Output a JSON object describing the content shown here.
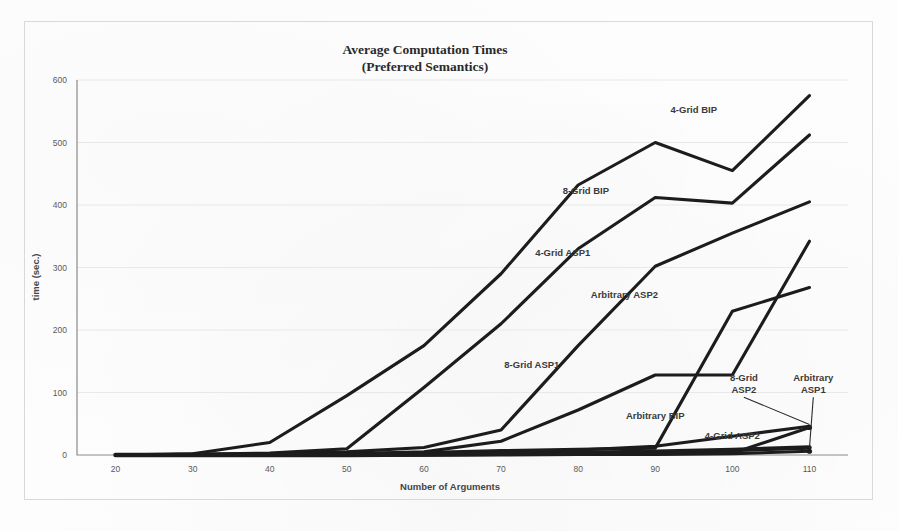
{
  "chart_data": {
    "type": "line",
    "title": "Average Computation Times",
    "subtitle": "(Preferred Semantics)",
    "xlabel": "Number of Arguments",
    "ylabel": "time (sec.)",
    "x": [
      20,
      30,
      40,
      50,
      60,
      70,
      80,
      90,
      100,
      110
    ],
    "xticks": [
      "20",
      "30",
      "40",
      "50",
      "60",
      "70",
      "80",
      "90",
      "100",
      "110"
    ],
    "yticks": [
      "0",
      "100",
      "200",
      "300",
      "400",
      "500",
      "600"
    ],
    "xlim": [
      15,
      115
    ],
    "ylim": [
      0,
      600
    ],
    "grid": true,
    "legend_position": "inline-annotations",
    "line_color": "#1c1c1c",
    "grid_color": "#e8e8e8",
    "axis_color": "#8a8a8a",
    "series": [
      {
        "name": "4-Grid BIP",
        "values": [
          0,
          2,
          20,
          95,
          175,
          290,
          432,
          500,
          455,
          575
        ],
        "label_x": 95,
        "label_y": 548,
        "anchor": "middle",
        "thick": false
      },
      {
        "name": "8-Grid BIP",
        "values": [
          0,
          1,
          3,
          10,
          108,
          210,
          330,
          412,
          403,
          512
        ],
        "label_x": 81,
        "label_y": 418,
        "anchor": "middle",
        "thick": false
      },
      {
        "name": "4-Grid ASP1",
        "values": [
          0,
          1,
          2,
          5,
          12,
          40,
          175,
          302,
          355,
          405
        ],
        "label_x": 78,
        "label_y": 318,
        "anchor": "middle",
        "thick": false
      },
      {
        "name": "Arbitrary ASP2",
        "values": [
          0,
          0,
          1,
          2,
          4,
          7,
          9,
          11,
          230,
          268
        ],
        "label_x": 86,
        "label_y": 252,
        "anchor": "middle",
        "thick": false
      },
      {
        "name": "8-Grid ASP1",
        "values": [
          0,
          0,
          1,
          2,
          5,
          22,
          72,
          128,
          128,
          342
        ],
        "label_x": 74,
        "label_y": 140,
        "anchor": "middle",
        "thick": false
      },
      {
        "name": "Arbitrary BIP",
        "values": [
          0,
          0,
          0,
          1,
          2,
          4,
          8,
          14,
          30,
          46
        ],
        "label_x": 90,
        "label_y": 58,
        "anchor": "middle",
        "thick": false
      },
      {
        "name": "4-Grid ASP2",
        "values": [
          0,
          0,
          0,
          0,
          1,
          2,
          3,
          5,
          8,
          12
        ],
        "label_x": 100,
        "label_y": 26,
        "anchor": "middle",
        "thick": true
      },
      {
        "name": "8-Grid ASP2",
        "values": [
          0,
          0,
          0,
          0,
          0,
          1,
          1,
          2,
          3,
          44
        ],
        "callout": true,
        "callout_lines": [
          "8-Grid",
          "ASP2"
        ],
        "callout_x": 101.5,
        "callout_y": 118,
        "point_x": 110,
        "point_y": 44,
        "thick": false
      },
      {
        "name": "Arbitrary ASP1",
        "values": [
          0,
          0,
          0,
          0,
          0,
          0,
          1,
          1,
          2,
          6
        ],
        "callout": true,
        "callout_lines": [
          "Arbitrary",
          "ASP1"
        ],
        "callout_x": 110.5,
        "callout_y": 118,
        "point_x": 110,
        "point_y": 6,
        "thick": false
      }
    ]
  }
}
